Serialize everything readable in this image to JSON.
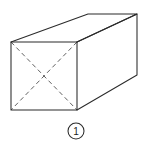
{
  "figure": {
    "background_color": "#ffffff",
    "edge_color": "#2b2b2b",
    "hidden_edge_color": "#585858",
    "callout": {
      "label": "1",
      "shape": "circle",
      "center_x": 76,
      "center_y": 131,
      "radius": 8
    },
    "geometry": {
      "type": "cuboid",
      "front_face": {
        "name": "square-front-face",
        "top_left": [
          11,
          42
        ],
        "top_right": [
          77,
          42
        ],
        "bottom_right": [
          77,
          110
        ],
        "bottom_left": [
          11,
          110
        ]
      },
      "back_face": {
        "name": "square-back-face",
        "top_left": [
          88,
          14
        ],
        "top_right": [
          137,
          14
        ],
        "bottom_right": [
          137,
          75
        ],
        "bottom_left": [
          88,
          75
        ]
      },
      "depth_offset": [
        60,
        -28
      ],
      "hidden_diagonals": [
        {
          "name": "diagonal-tl-br",
          "from": [
            11,
            42
          ],
          "to": [
            77,
            110
          ]
        },
        {
          "name": "diagonal-tr-bl",
          "from": [
            77,
            42
          ],
          "to": [
            11,
            110
          ]
        }
      ],
      "visible_faces": [
        "front",
        "top",
        "right"
      ],
      "hidden_faces": [
        "back",
        "bottom",
        "left"
      ]
    }
  }
}
